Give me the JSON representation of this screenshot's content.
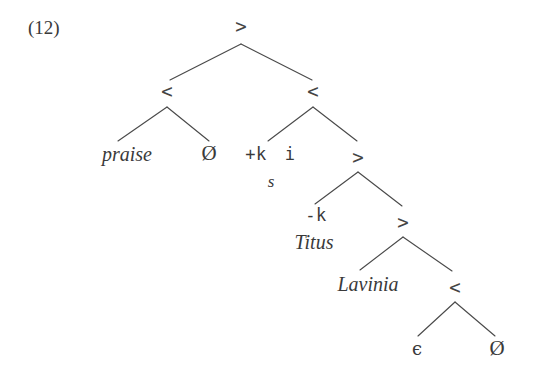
{
  "figure": {
    "example_number": "(12)",
    "line_color": "#4a4a4a",
    "text_color": "#3a3a3a",
    "background": "#ffffff"
  },
  "nodes": {
    "root": ">",
    "left_merge": "<",
    "right_merge": "<",
    "mid_move": ">",
    "lower_move": ">",
    "bottom_move": ">",
    "bottom_merge": "<"
  },
  "leaves": {
    "praise": "praise",
    "empty_1": "Ø",
    "feature_plus_k": "+k",
    "feature_i": "i",
    "trace_s": "s",
    "feature_minus_k": "-k",
    "titus": "Titus",
    "lavinia": "Lavinia",
    "epsilon": "ϵ",
    "empty_2": "Ø"
  }
}
